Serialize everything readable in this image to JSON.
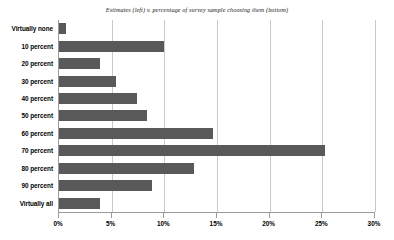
{
  "chart_data": {
    "type": "bar",
    "orientation": "horizontal",
    "title": "Estimates (left) v. percentage of survey sample choosing them (bottom)",
    "xlabel": "",
    "ylabel": "",
    "categories": [
      "Virtually none",
      "10 percent",
      "20 percent",
      "30 percent",
      "40 percent",
      "50 percent",
      "60 percent",
      "70 percent",
      "80 percent",
      "90 percent",
      "Virtually all"
    ],
    "values": [
      0.7,
      10.0,
      3.9,
      5.4,
      7.4,
      8.4,
      14.6,
      25.3,
      12.8,
      8.8,
      3.9
    ],
    "xlim": [
      0,
      30
    ],
    "xticks": [
      0,
      5,
      10,
      15,
      20,
      25,
      30
    ],
    "xtick_labels": [
      "0%",
      "5%",
      "10%",
      "15%",
      "20%",
      "25%",
      "30%"
    ],
    "grid": true,
    "legend": false,
    "bar_color": "#595959",
    "gridline_color": "#c8c8c8",
    "axis_color": "#9a9a9a",
    "background_color": "#ffffff"
  }
}
